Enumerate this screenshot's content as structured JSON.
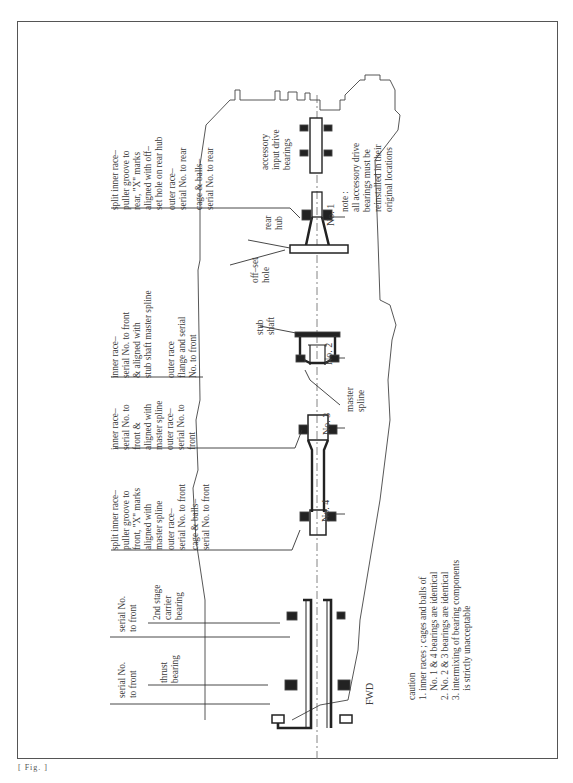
{
  "diagram": {
    "orientation": "rotated 90° counter-clockwise",
    "forward_label": "FWD",
    "labels": {
      "rear_split_inner_race": [
        "split inner race–",
        "puller groove to",
        "rear, \"X\" marks",
        "aligned with off–",
        "set hole on rear hub"
      ],
      "rear_outer_race": [
        "outer race–",
        "serial No. to rear"
      ],
      "rear_cage_balls": [
        "cage & balls–",
        "serial No. to rear"
      ],
      "no2_inner_race": [
        "inner race–",
        "serial No. to front",
        "& aligned with",
        "stub shaft master spline"
      ],
      "no2_outer_race": [
        "outer race",
        "flange and serial",
        "No. to front"
      ],
      "no3_inner_race": [
        "inner race–",
        "serial No. to",
        "front &",
        "aligned with",
        "master spline"
      ],
      "no3_outer_race": [
        "outer race–",
        "serial No. to",
        "front"
      ],
      "no4_split_inner_race": [
        "split inner race–",
        "puller groove to",
        "front, \"X\" marks",
        "aligned with",
        "master spline"
      ],
      "no4_outer_race": [
        "outer race–",
        "serial No. to front"
      ],
      "no4_cage_balls": [
        "cage & balls–",
        "serial No. to front"
      ],
      "serial_front_1": [
        "serial No.",
        "to front"
      ],
      "carrier_bearing": [
        "2nd stage",
        "carrier",
        "bearing"
      ],
      "serial_front_2": [
        "serial No.",
        "to front"
      ],
      "thrust_bearing": [
        "thrust",
        "bearing"
      ],
      "accessory_bearings": [
        "accessory",
        "input drive",
        "bearings"
      ],
      "rear_hub": [
        "rear",
        "hub"
      ],
      "offset_hole": [
        "off–set",
        "hole"
      ],
      "stub_shaft": [
        "stub",
        "shaft"
      ],
      "master_spline": [
        "master",
        "spline"
      ],
      "no1": "No. 1",
      "no2": "No. 2",
      "no3": "No. 3",
      "no4": "No. 4"
    },
    "note": {
      "title": "note :",
      "lines": [
        "all accessory drive",
        "bearings must be",
        "reinstalled in their",
        "original locations"
      ]
    },
    "caution": {
      "title": "caution",
      "lines": [
        "1. inner races ; cages and balls of",
        "    No. 1 & 4 bearings are identical",
        "2. No. 2 & 3 bearings are identical",
        "3. intermixing of bearing components",
        "    is strictly unacceptable"
      ]
    },
    "footer": "[ Fig. ]"
  }
}
